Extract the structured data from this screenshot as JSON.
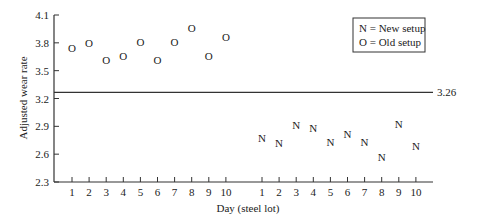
{
  "chart_data": {
    "type": "scatter",
    "title": "",
    "xlabel": "Day (steel lot)",
    "ylabel": "Adjusted wear rate",
    "ylim": [
      2.3,
      4.1
    ],
    "y_ticks": [
      "2.3",
      "2.6",
      "2.9",
      "3.2",
      "3.5",
      "3.8",
      "4.1"
    ],
    "y_tick_values": [
      2.3,
      2.6,
      2.9,
      3.2,
      3.5,
      3.8,
      4.1
    ],
    "grid": false,
    "legend_position": "upper right",
    "legend": [
      {
        "symbol": "N",
        "label": "N = New setup"
      },
      {
        "symbol": "O",
        "label": "O = Old setup"
      }
    ],
    "reference_line": {
      "value": 3.26,
      "label": "3.26"
    },
    "series": [
      {
        "name": "Old setup",
        "symbol": "O",
        "x": [
          1,
          2,
          3,
          4,
          5,
          6,
          7,
          8,
          9,
          10
        ],
        "values": [
          3.74,
          3.8,
          3.62,
          3.66,
          3.81,
          3.62,
          3.81,
          3.96,
          3.66,
          3.86
        ]
      },
      {
        "name": "New setup",
        "symbol": "N",
        "x": [
          1,
          2,
          3,
          4,
          5,
          6,
          7,
          8,
          9,
          10
        ],
        "values": [
          2.77,
          2.72,
          2.91,
          2.88,
          2.73,
          2.82,
          2.73,
          2.57,
          2.93,
          2.69
        ]
      }
    ],
    "x_tick_groups": [
      {
        "group": "Old setup",
        "labels": [
          "1",
          "2",
          "3",
          "4",
          "5",
          "6",
          "7",
          "8",
          "9",
          "10"
        ]
      },
      {
        "group": "New setup",
        "labels": [
          "1",
          "2",
          "3",
          "4",
          "5",
          "6",
          "7",
          "8",
          "9",
          "10"
        ]
      }
    ]
  }
}
